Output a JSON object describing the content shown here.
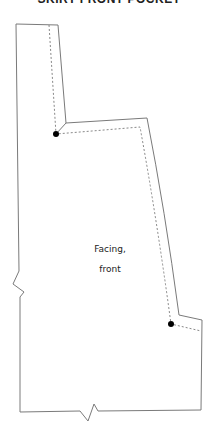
{
  "title": "SKIRT FRONT POCKET",
  "piece": {
    "label_line1": "Facing,",
    "label_line2": "front"
  },
  "colors": {
    "cut_line": "#7a7a7a",
    "seam_line": "#7a7a7a",
    "marker_dot": "#000000",
    "text": "#222222",
    "background": "#ffffff"
  },
  "legend": {
    "cut_line": "solid",
    "seam_line": "dashed",
    "markers": "dot",
    "notches": "zigzag"
  }
}
